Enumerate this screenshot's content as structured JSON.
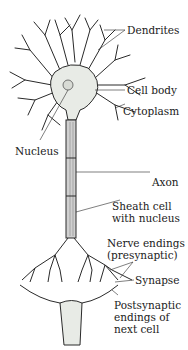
{
  "labels": {
    "dendrites": "Dendrites",
    "cell_body": "Cell body",
    "cytoplasm": "Cytoplasm",
    "nucleus": "Nucleus",
    "axon": "Axon",
    "sheath_1": "Sheath cell",
    "sheath_2": "with nucleus",
    "nerve_1": "Nerve endings",
    "nerve_2": "(presynaptic)",
    "synapse": "Synapse",
    "post_1": "Postsynaptic",
    "post_2": "endings of",
    "post_3": "next cell"
  },
  "colors": {
    "cell_fill": "#e8ebe6",
    "outline": "#2a2a2a",
    "sheath": "#9a9a9a",
    "text": "#1a1a1a"
  }
}
